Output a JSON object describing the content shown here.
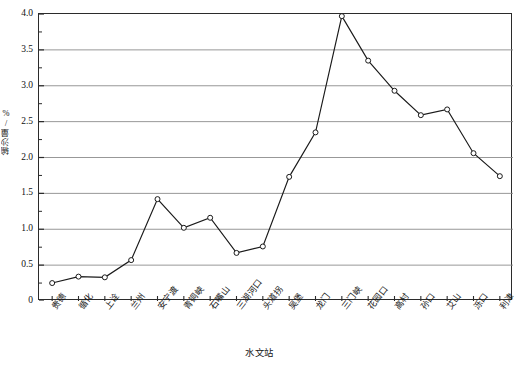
{
  "chart_data": {
    "type": "line",
    "title": "",
    "xlabel": "水文站",
    "ylabel": "输沙量/%",
    "ylim": [
      0,
      4.0
    ],
    "ytick_labels": [
      "0",
      "0.5",
      "1.0",
      "1.5",
      "2.0",
      "2.5",
      "3.0",
      "3.5",
      "4.0"
    ],
    "ytick_values": [
      0,
      0.5,
      1.0,
      1.5,
      2.0,
      2.5,
      3.0,
      3.5,
      4.0
    ],
    "ytick_minor_step": 0.25,
    "grid": "horizontal-major",
    "grid_color": "#8c8c8c",
    "line_color": "#1a1a1a",
    "marker": "open-circle",
    "marker_edge_color": "#1a1a1a",
    "marker_face_color": "#ffffff",
    "legend": "none",
    "categories": [
      "贵德",
      "循化",
      "上诠",
      "兰州",
      "安宁渡",
      "青铜峡",
      "石嘴山",
      "三湖河口",
      "头道拐",
      "吴堡",
      "龙门",
      "三门峡",
      "花园口",
      "高村",
      "孙口",
      "艾山",
      "泺口",
      "利津"
    ],
    "values": [
      0.25,
      0.34,
      0.33,
      0.57,
      1.42,
      1.02,
      1.16,
      0.67,
      0.76,
      1.73,
      2.35,
      3.97,
      3.35,
      2.93,
      2.59,
      2.67,
      2.06,
      1.74
    ]
  },
  "axes": {
    "y_axis_label": "输沙量/%",
    "x_axis_label": "水文站"
  }
}
